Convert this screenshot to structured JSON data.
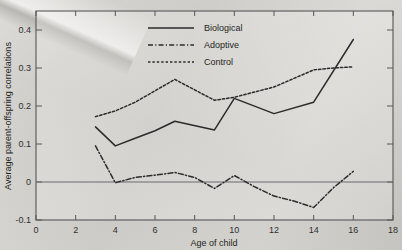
{
  "chart_data": {
    "type": "line",
    "title": "",
    "xlabel": "Age of child",
    "ylabel": "Average parent-offspring correlations",
    "xlim": [
      0,
      18
    ],
    "ylim": [
      -0.1,
      0.45
    ],
    "xticks": [
      0,
      2,
      4,
      6,
      8,
      10,
      12,
      14,
      16,
      18
    ],
    "xtick_labels": [
      "0",
      "2",
      "4",
      "6",
      "8",
      "10",
      "12",
      "14",
      "16",
      "18"
    ],
    "yticks": [
      -0.1,
      0,
      0.1,
      0.2,
      0.3,
      0.4
    ],
    "ytick_labels": [
      "-0.1",
      "0",
      "0.1",
      "0.2",
      "0.3",
      "0.4"
    ],
    "grid": false,
    "legend_position": "top-center",
    "zero_reference_line": 0,
    "series": [
      {
        "name": "Biological",
        "style": "solid",
        "color": "#2b2b2d",
        "x": [
          3,
          4,
          5,
          6,
          7,
          9,
          10,
          12,
          14,
          16
        ],
        "values": [
          0.145,
          0.095,
          0.115,
          0.135,
          0.16,
          0.137,
          0.22,
          0.18,
          0.21,
          0.375
        ]
      },
      {
        "name": "Adoptive",
        "style": "dash-dot",
        "color": "#2b2b2d",
        "x": [
          3,
          4,
          5,
          6,
          7,
          8,
          9,
          10,
          11,
          12,
          13,
          14,
          15,
          16
        ],
        "values": [
          0.095,
          -0.002,
          0.012,
          0.018,
          0.025,
          0.012,
          -0.017,
          0.017,
          -0.012,
          -0.037,
          -0.05,
          -0.067,
          -0.015,
          0.028
        ]
      },
      {
        "name": "Control",
        "style": "dotted",
        "color": "#2b2b2d",
        "x": [
          3,
          4,
          5,
          6,
          7,
          9,
          10,
          12,
          14,
          15,
          16
        ],
        "values": [
          0.172,
          0.187,
          0.21,
          0.24,
          0.27,
          0.215,
          0.223,
          0.25,
          0.295,
          0.3,
          0.303
        ]
      }
    ]
  },
  "legend": {
    "items": [
      {
        "label": "Biological"
      },
      {
        "label": "Adoptive"
      },
      {
        "label": "Control"
      }
    ]
  },
  "axes": {
    "x_title": "Age of child",
    "y_title": "Average parent-offspring correlations"
  }
}
